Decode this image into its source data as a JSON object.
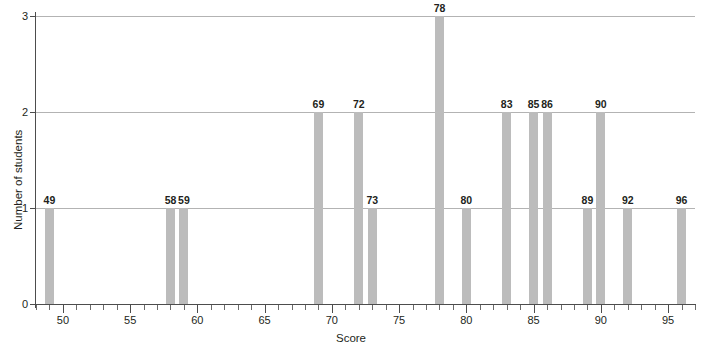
{
  "chart_data": {
    "type": "bar",
    "title": "",
    "xlabel": "Score",
    "ylabel": "Number of students",
    "xlim": [
      48,
      97
    ],
    "ylim": [
      0,
      3
    ],
    "grid": true,
    "legend": null,
    "bar_color": "#bcbcbc",
    "axis_color": "#4d4d4d",
    "gridline_color": "#b3b3b3",
    "x_tick_labels": [
      "50",
      "55",
      "60",
      "65",
      "70",
      "75",
      "80",
      "85",
      "90",
      "95"
    ],
    "x_tick_values": [
      50,
      55,
      60,
      65,
      70,
      75,
      80,
      85,
      90,
      95
    ],
    "x_minor_tick_step": 1,
    "y_tick_labels": [
      "0",
      "1",
      "2",
      "3"
    ],
    "y_tick_values": [
      0,
      1,
      2,
      3
    ],
    "categories": [
      49,
      58,
      59,
      69,
      72,
      73,
      78,
      80,
      83,
      85,
      86,
      89,
      90,
      92,
      96
    ],
    "values": [
      1,
      1,
      1,
      2,
      2,
      1,
      3,
      1,
      2,
      2,
      2,
      1,
      2,
      1,
      1
    ],
    "data_labels": [
      "49",
      "58",
      "59",
      "69",
      "72",
      "73",
      "78",
      "80",
      "83",
      "85",
      "86",
      "89",
      "90",
      "92",
      "96"
    ],
    "total_students": 21
  },
  "axis": {
    "x_title": "Score",
    "y_title": "Number of students"
  }
}
